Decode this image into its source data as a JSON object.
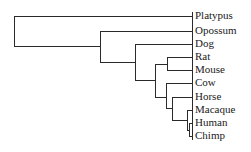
{
  "diagram": {
    "type": "phylogenetic-tree",
    "line_color": "#2a2a2a",
    "leaves": [
      {
        "label": "Platypus",
        "y": 16
      },
      {
        "label": "Opossum",
        "y": 31
      },
      {
        "label": "Dog",
        "y": 44
      },
      {
        "label": "Rat",
        "y": 57
      },
      {
        "label": "Mouse",
        "y": 70
      },
      {
        "label": "Cow",
        "y": 83
      },
      {
        "label": "Horse",
        "y": 97
      },
      {
        "label": "Macaque",
        "y": 110
      },
      {
        "label": "Human",
        "y": 123
      },
      {
        "label": "Chimp",
        "y": 136
      }
    ]
  }
}
